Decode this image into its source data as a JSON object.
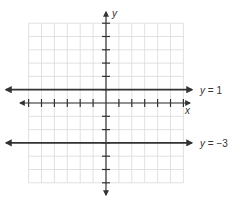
{
  "chart_data": {
    "type": "line",
    "title": "",
    "xlabel": "x",
    "ylabel": "y",
    "xlim": [
      -6,
      6
    ],
    "ylim": [
      -6,
      6
    ],
    "grid": true,
    "series": [
      {
        "name": "y = 1",
        "equation": "y = 1",
        "x": [
          -7,
          7
        ],
        "values": [
          1,
          1
        ]
      },
      {
        "name": "y = -3",
        "equation": "y = −3",
        "x": [
          -7,
          7
        ],
        "values": [
          -3,
          -3
        ]
      }
    ]
  },
  "labels": {
    "x_axis": "x",
    "y_axis": "y",
    "line1_var": "y",
    "line1_rest": " = 1",
    "line2_var": "y",
    "line2_rest": " = −3"
  },
  "colors": {
    "grid": "#d9d9d9",
    "axis": "#333333",
    "lines": "#333333"
  }
}
